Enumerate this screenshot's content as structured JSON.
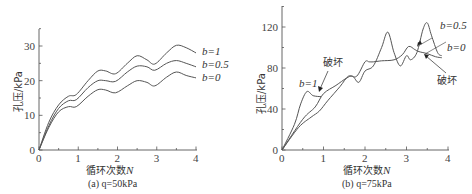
{
  "chart_data": [
    {
      "type": "line",
      "caption": "(a) q=50kPa",
      "xlabel": "循环次数N",
      "ylabel": "孔压/kPa",
      "xticks": [
        "0",
        "1",
        "2",
        "3",
        "4"
      ],
      "yticks": [
        "0",
        "10",
        "20",
        "30"
      ],
      "xlim": [
        0,
        4
      ],
      "ylim": [
        0,
        35
      ],
      "grid": false,
      "legend_position": "right, inline labels",
      "series": [
        {
          "name": "b=1",
          "x": [
            0,
            0.25,
            0.5,
            0.75,
            0.95,
            1.25,
            1.5,
            1.7,
            1.95,
            2.25,
            2.5,
            2.75,
            2.95,
            3.25,
            3.5,
            3.75,
            4.0
          ],
          "values": [
            0,
            8,
            13,
            15.5,
            16,
            20,
            22.8,
            22.8,
            22,
            25,
            27.2,
            26,
            24.8,
            28,
            30.2,
            29.5,
            28
          ]
        },
        {
          "name": "b=0.5",
          "x": [
            0,
            0.25,
            0.5,
            0.75,
            0.95,
            1.25,
            1.5,
            1.7,
            1.95,
            2.25,
            2.5,
            2.75,
            2.95,
            3.25,
            3.5,
            3.75,
            4.0
          ],
          "values": [
            0,
            7,
            12,
            14.2,
            14.5,
            18,
            20,
            20,
            19.8,
            22.5,
            24.2,
            24,
            23,
            25,
            25.8,
            25,
            24
          ]
        },
        {
          "name": "b=0",
          "x": [
            0,
            0.25,
            0.5,
            0.75,
            0.95,
            1.25,
            1.5,
            1.7,
            1.95,
            2.25,
            2.5,
            2.75,
            2.95,
            3.25,
            3.5,
            3.75,
            4.0
          ],
          "values": [
            0,
            6.5,
            11,
            12.5,
            12.5,
            15.5,
            17.4,
            17.3,
            16.5,
            18.5,
            20,
            19.5,
            18.5,
            21,
            22.5,
            21.5,
            20.8
          ]
        }
      ]
    },
    {
      "type": "line",
      "caption": "(b) q=75kPa",
      "xlabel": "循环次数N",
      "ylabel": "孔压/kPa",
      "xticks": [
        "0",
        "1",
        "2",
        "3",
        "4"
      ],
      "yticks": [
        "0",
        "40",
        "80",
        "120"
      ],
      "xlim": [
        0,
        4
      ],
      "ylim": [
        0,
        140
      ],
      "grid": false,
      "legend_position": "inline labels",
      "annotations": [
        {
          "text": "破坏",
          "target": "b=1 failure near N≈0.95"
        },
        {
          "text": "破坏",
          "target": "b=0 failure near N≈3.85"
        }
      ],
      "series": [
        {
          "name": "b=1",
          "x": [
            0,
            0.3,
            0.45,
            0.6,
            0.75,
            0.95
          ],
          "values": [
            0,
            25,
            45,
            57,
            53,
            52
          ]
        },
        {
          "name": "b=0.5",
          "x": [
            0,
            0.5,
            0.8,
            1.0,
            1.3,
            1.55,
            1.7,
            1.85,
            2.0,
            2.2,
            2.4,
            2.55,
            2.7,
            2.85,
            3.0,
            3.1,
            3.25,
            3.4,
            3.5,
            3.6,
            3.75,
            3.85
          ],
          "values": [
            0,
            30,
            42,
            55,
            63,
            70,
            72,
            66,
            77,
            82,
            100,
            115,
            95,
            82,
            92,
            88,
            95,
            118,
            124,
            112,
            95,
            92
          ]
        },
        {
          "name": "b=0",
          "x": [
            0,
            0.4,
            0.7,
            0.9,
            1.1,
            1.4,
            1.6,
            1.8,
            2.0,
            2.1,
            2.2,
            2.4,
            2.7,
            2.9,
            3.05,
            3.2,
            3.3,
            3.5,
            3.7,
            3.85
          ],
          "values": [
            0,
            22,
            32,
            38,
            48,
            62,
            72,
            72,
            86,
            86,
            86,
            87,
            88,
            93,
            101,
            98,
            96,
            94,
            91,
            90
          ]
        }
      ]
    }
  ],
  "labels": {
    "a": {
      "caption": "(a) q=50kPa",
      "xlabel_cjk": "循环次数",
      "xlabel_var": "N",
      "ylabel": "孔压/kPa",
      "series_labels": [
        "b=1",
        "b=0.5",
        "b=0"
      ]
    },
    "b": {
      "caption": "(b) q=75kPa",
      "xlabel_cjk": "循环次数",
      "xlabel_var": "N",
      "ylabel": "孔压/kPa",
      "series_labels": [
        "b=1",
        "b=0.5",
        "b=0"
      ],
      "failure_label": "破坏"
    }
  }
}
